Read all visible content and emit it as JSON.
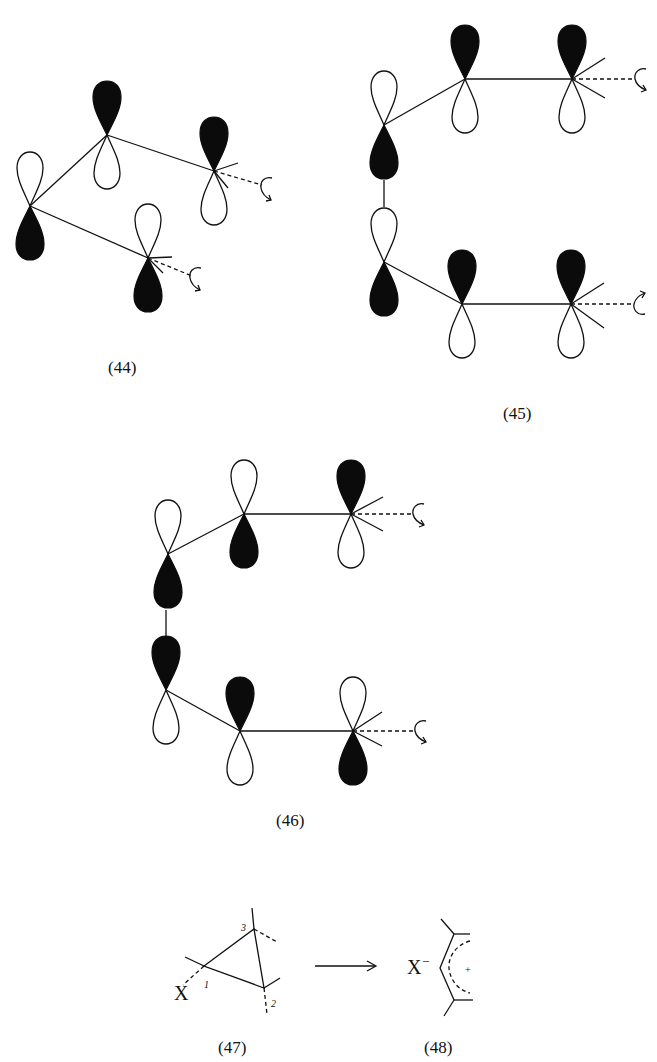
{
  "figure": {
    "structures": [
      {
        "id": "44",
        "label": "(44)",
        "description": "Four-centre p-orbital array, two terminal rotating centres"
      },
      {
        "id": "45",
        "label": "(45)",
        "description": "Six-centre p-orbital array, conrotatory terminal rotation"
      },
      {
        "id": "46",
        "label": "(46)",
        "description": "Six-centre p-orbital array with alternate phases"
      },
      {
        "id": "47",
        "label": "(47)",
        "description": "Cyclopropyl derivative with leaving group X"
      },
      {
        "id": "48",
        "label": "(48)",
        "description": "Allyl cation with X- counterion"
      }
    ],
    "reaction": {
      "leaving_group": "X",
      "anion": "X",
      "anion_charge": "−",
      "cation_charge": "+",
      "atom_numbers": [
        "1",
        "2",
        "3"
      ],
      "arrow": "→"
    },
    "colors": {
      "ink": "#111111",
      "filled_lobe": "#0b0b0b",
      "background": "#ffffff"
    }
  }
}
